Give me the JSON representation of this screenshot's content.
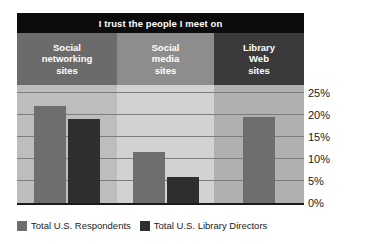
{
  "chart_data": {
    "type": "bar",
    "title": "I trust the people I meet on",
    "xlabel": "",
    "ylabel": "",
    "ylim": [
      0,
      25
    ],
    "grid": true,
    "legend_position": "bottom-left",
    "categories": [
      "Social networking sites",
      "Social media sites",
      "Library Web sites"
    ],
    "category_lines": [
      [
        "Social",
        "networking",
        "sites"
      ],
      [
        "Social",
        "media",
        "sites"
      ],
      [
        "Library",
        "Web",
        "sites"
      ]
    ],
    "series": [
      {
        "name": "Total U.S. Respondents",
        "color": "#6e6e6e",
        "values": [
          22,
          11.5,
          19.5
        ]
      },
      {
        "name": "Total U.S. Library Directors",
        "color": "#2e2e2e",
        "values": [
          19,
          6,
          null
        ]
      }
    ],
    "ticks": [
      {
        "label": "25%",
        "value": 25
      },
      {
        "label": "20%",
        "value": 20
      },
      {
        "label": "15%",
        "value": 15
      },
      {
        "label": "10%",
        "value": 10
      },
      {
        "label": "5%",
        "value": 5
      },
      {
        "label": "0%",
        "value": 0
      }
    ],
    "band_colors": [
      "#bdbdbd",
      "#d2d2d2",
      "#b0b0b0"
    ],
    "header_colors": [
      "#6b6b6b",
      "#8d8d8d",
      "#3a3a3a"
    ],
    "title_color": "#0c0c0c",
    "gridline_color": "#7d7d7d",
    "baseline_color": "#1b1b1b"
  }
}
